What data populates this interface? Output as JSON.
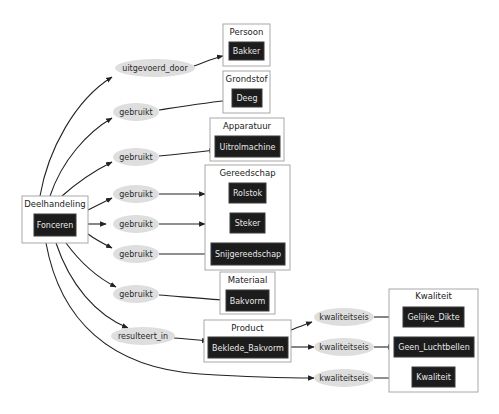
{
  "diagram": {
    "type": "concept-graph",
    "source_cluster": {
      "title": "Deelhandeling",
      "node": "Fonceren"
    },
    "clusters": {
      "persoon": {
        "title": "Persoon",
        "nodes": [
          "Bakker"
        ]
      },
      "grondstof": {
        "title": "Grondstof",
        "nodes": [
          "Deeg"
        ]
      },
      "apparatuur": {
        "title": "Apparatuur",
        "nodes": [
          "Uitrolmachine"
        ]
      },
      "gereedschap": {
        "title": "Gereedschap",
        "nodes": [
          "Rolstok",
          "Steker",
          "Snijgereedschap"
        ]
      },
      "materiaal": {
        "title": "Materiaal",
        "nodes": [
          "Bakvorm"
        ]
      },
      "product": {
        "title": "Product",
        "nodes": [
          "Beklede_Bakvorm"
        ]
      },
      "kwaliteit": {
        "title": "Kwaliteit",
        "nodes": [
          "Gelijke_Dikte",
          "Geen_Luchtbellen",
          "Kwaliteit"
        ]
      }
    },
    "relations": [
      {
        "label": "uitgevoerd_door",
        "from": "Fonceren",
        "to": "Bakker"
      },
      {
        "label": "gebruikt",
        "from": "Fonceren",
        "to": "Deeg"
      },
      {
        "label": "gebruikt",
        "from": "Fonceren",
        "to": "Uitrolmachine"
      },
      {
        "label": "gebruikt",
        "from": "Fonceren",
        "to": "Rolstok"
      },
      {
        "label": "gebruikt",
        "from": "Fonceren",
        "to": "Steker"
      },
      {
        "label": "gebruikt",
        "from": "Fonceren",
        "to": "Snijgereedschap"
      },
      {
        "label": "gebruikt",
        "from": "Fonceren",
        "to": "Bakvorm"
      },
      {
        "label": "resulteert_in",
        "from": "Fonceren",
        "to": "Beklede_Bakvorm"
      },
      {
        "label": "kwaliteitseis",
        "from": "Beklede_Bakvorm",
        "to": "Gelijke_Dikte"
      },
      {
        "label": "kwaliteitseis",
        "from": "Beklede_Bakvorm",
        "to": "Geen_Luchtbellen"
      },
      {
        "label": "kwaliteitseis",
        "from": "Fonceren",
        "to": "Kwaliteit"
      }
    ],
    "colors": {
      "node_fill": "#1c1c1c",
      "node_text": "#e8e8e8",
      "cluster_border": "#a8a8a8",
      "edge_label_fill": "#dedede",
      "edge_stroke": "#222222"
    }
  }
}
